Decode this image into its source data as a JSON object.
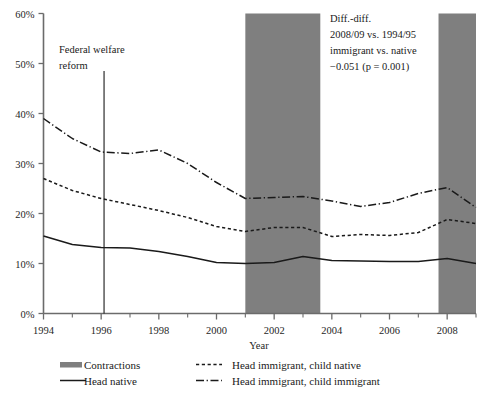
{
  "chart_data": {
    "type": "line",
    "title": "",
    "xlabel": "Year",
    "ylabel": "",
    "xlim": [
      1994,
      2009
    ],
    "ylim": [
      0,
      60
    ],
    "grid": false,
    "legend_position": "bottom",
    "x": [
      1994,
      1995,
      1996,
      1997,
      1998,
      1999,
      2000,
      2001,
      2002,
      2003,
      2004,
      2005,
      2006,
      2007,
      2008,
      2009
    ],
    "ytick_labels": [
      "0%",
      "10%",
      "20%",
      "30%",
      "40%",
      "50%",
      "60%"
    ],
    "ytick_values": [
      0,
      10,
      20,
      30,
      40,
      50,
      60
    ],
    "xtick_labels": [
      "1994",
      "1996",
      "1998",
      "2000",
      "2002",
      "2004",
      "2006",
      "2008"
    ],
    "xtick_values": [
      1994,
      1996,
      1998,
      2000,
      2002,
      2004,
      2006,
      2008
    ],
    "xminor_values": [
      1995,
      1997,
      1999,
      2001,
      2003,
      2005,
      2007,
      2009
    ],
    "series": [
      {
        "name": "Head native",
        "style": "solid",
        "values": [
          15.5,
          13.8,
          13.2,
          13.1,
          12.4,
          11.4,
          10.2,
          10.0,
          10.2,
          11.4,
          10.6,
          10.5,
          10.4,
          10.4,
          11.0,
          10.0
        ]
      },
      {
        "name": "Head immigrant, child native",
        "style": "dashed",
        "values": [
          27.0,
          24.6,
          23.0,
          21.8,
          20.6,
          19.2,
          17.4,
          16.4,
          17.2,
          17.2,
          15.4,
          15.8,
          15.6,
          16.2,
          18.8,
          18.0
        ]
      },
      {
        "name": "Head immigrant, child immigrant",
        "style": "dashdot",
        "values": [
          39.0,
          35.0,
          32.3,
          32.0,
          32.7,
          30.0,
          26.2,
          23.0,
          23.2,
          23.4,
          22.5,
          21.4,
          22.2,
          24.0,
          25.2,
          21.2
        ]
      }
    ],
    "shaded_bands": {
      "name": "Contractions",
      "color": "#7f7f7f",
      "spans": [
        [
          2001.0,
          2003.6
        ],
        [
          2007.7,
          2009.0
        ]
      ]
    },
    "vline": {
      "x": 1996.1,
      "label_line1": "Federal welfare",
      "label_line2": "reform"
    },
    "annotation": {
      "line1": "Diff.-diff.",
      "line2": "2008/09 vs. 1994/95",
      "line3": "immigrant vs. native",
      "line4": "−0.051 (p = 0.001)"
    },
    "legend": [
      {
        "label": "Contractions",
        "style": "band"
      },
      {
        "label": "Head immigrant, child native",
        "style": "dashed"
      },
      {
        "label": "Head native",
        "style": "solid"
      },
      {
        "label": "Head immigrant, child immigrant",
        "style": "dashdot"
      }
    ]
  },
  "colors": {
    "axis": "#6b6b6b",
    "line": "#1a1a1a",
    "band": "#7f7f7f",
    "text": "#1a1a1a"
  }
}
